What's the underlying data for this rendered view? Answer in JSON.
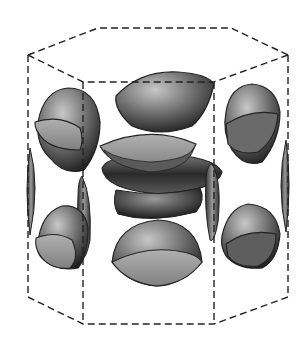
{
  "figure": {
    "colors": {
      "background": "#ffffff",
      "edge_line": "#222222",
      "surface_dark": "#2a2a2a",
      "surface_mid": "#6e6e6e",
      "surface_light": "#b8b8b8",
      "cap_face": "#9a9a9a"
    },
    "prism": {
      "top": [
        [
          28,
          55
        ],
        [
          98,
          28
        ],
        [
          231,
          28
        ],
        [
          288,
          55
        ],
        [
          214,
          82
        ],
        [
          83,
          82
        ]
      ],
      "bottom": [
        [
          28,
          297
        ],
        [
          83,
          324
        ],
        [
          214,
          324
        ],
        [
          288,
          297
        ]
      ],
      "hidden_top_back": [
        [
          28,
          55
        ],
        [
          98,
          28
        ],
        [
          231,
          28
        ],
        [
          288,
          55
        ]
      ]
    }
  }
}
